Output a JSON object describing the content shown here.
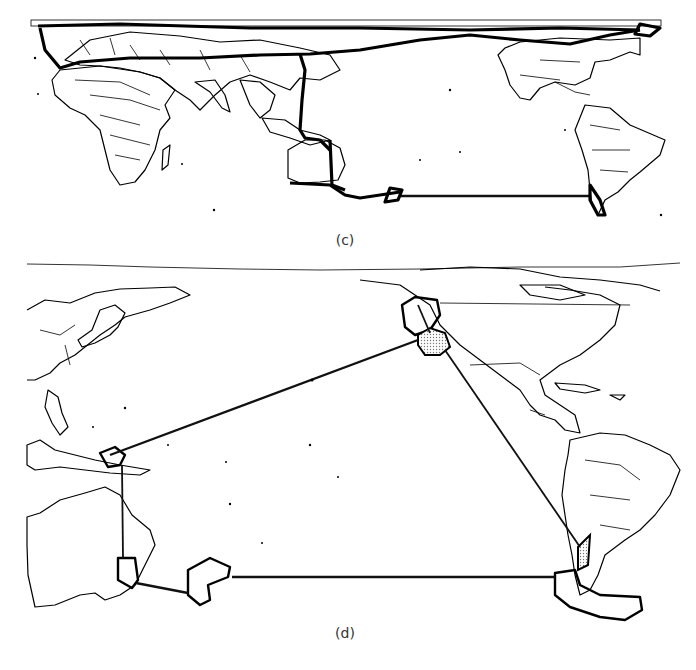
{
  "figure": {
    "panels": [
      {
        "id": "c",
        "caption": "(c)",
        "description": "World map (Africa/Eurasia left, Pacific center, Americas right) with heavy route lines across the northern latitudes, down through Southeast Asia to Australia, and an eastbound line from New Zealand to southern South America."
      },
      {
        "id": "d",
        "caption": "(d)",
        "description": "Pacific-centered map with outlined regions (North America west coast, Papua/Southeast Asia, Tasmania, New Zealand, southern Chile) connected by straight route lines; two regions shaded with dot pattern."
      }
    ],
    "colors": {
      "line": "#000000",
      "background": "#ffffff",
      "shading": "#bbbbbb"
    }
  }
}
